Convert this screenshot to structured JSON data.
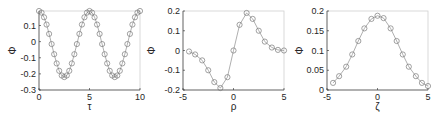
{
  "figure": {
    "background": "#ffffff",
    "axis_color": "#262626",
    "frame_color": "#d0d0d0",
    "line_color": "#8c8c8c",
    "marker_color": "#7a7a7a"
  },
  "chart_data": [
    {
      "type": "line",
      "title": "",
      "xlabel": "τ",
      "ylabel": "Φ",
      "xlim": [
        0,
        10
      ],
      "ylim": [
        -0.3,
        0.19
      ],
      "xticks": [
        0,
        5,
        10
      ],
      "xtick_labels": [
        "0",
        "5",
        "10"
      ],
      "yticks": [
        -0.3,
        -0.2,
        -0.1,
        0,
        0.1
      ],
      "ytick_labels": [
        "-0.3",
        "-0.2",
        "-0.1",
        "0",
        "0.1"
      ],
      "grid": false,
      "marker": "circle",
      "x": [
        0,
        0.25,
        0.5,
        0.75,
        1,
        1.25,
        1.5,
        1.75,
        2,
        2.25,
        2.5,
        2.75,
        3,
        3.25,
        3.5,
        3.75,
        4,
        4.25,
        4.5,
        4.75,
        5,
        5.25,
        5.5,
        5.75,
        6,
        6.25,
        6.5,
        6.75,
        7,
        7.25,
        7.5,
        7.75,
        8,
        8.25,
        8.5,
        8.75,
        9,
        9.25,
        9.5,
        9.75,
        10
      ],
      "y": [
        0.19,
        0.18,
        0.151,
        0.106,
        0.048,
        -0.015,
        -0.078,
        -0.135,
        -0.181,
        -0.21,
        -0.22,
        -0.21,
        -0.181,
        -0.135,
        -0.078,
        -0.015,
        0.048,
        0.106,
        0.151,
        0.18,
        0.19,
        0.18,
        0.151,
        0.106,
        0.048,
        -0.015,
        -0.078,
        -0.135,
        -0.181,
        -0.21,
        -0.22,
        -0.21,
        -0.181,
        -0.135,
        -0.078,
        -0.015,
        0.048,
        0.106,
        0.151,
        0.18,
        0.19
      ]
    },
    {
      "type": "line",
      "title": "",
      "xlabel": "ρ",
      "ylabel": "Φ",
      "xlim": [
        -5,
        5
      ],
      "ylim": [
        -0.2,
        0.2
      ],
      "xticks": [
        -5,
        0,
        5
      ],
      "xtick_labels": [
        "-5",
        "0",
        "5"
      ],
      "yticks": [
        -0.2,
        -0.1,
        0,
        0.1,
        0.2
      ],
      "ytick_labels": [
        "-0.2",
        "-0.1",
        "0",
        "0.1",
        "0.2"
      ],
      "grid": false,
      "marker": "circle",
      "x": [
        -4.4,
        -3.8,
        -3.1,
        -2.5,
        -1.9,
        -1.3,
        -0.6,
        0,
        0.6,
        1.3,
        1.9,
        2.5,
        3.1,
        3.8,
        4.4,
        5
      ],
      "y": [
        -0.005,
        -0.02,
        -0.05,
        -0.1,
        -0.16,
        -0.19,
        -0.135,
        0,
        0.13,
        0.19,
        0.16,
        0.1,
        0.045,
        0.015,
        0.003,
        0
      ]
    },
    {
      "type": "line",
      "title": "",
      "xlabel": "ζ",
      "ylabel": "Φ",
      "xlim": [
        -5,
        5
      ],
      "ylim": [
        0,
        0.2
      ],
      "xticks": [
        -5,
        0,
        5
      ],
      "xtick_labels": [
        "-5",
        "0",
        "5"
      ],
      "yticks": [
        0,
        0.05,
        0.1,
        0.15,
        0.2
      ],
      "ytick_labels": [
        "0",
        "0.05",
        "0.1",
        "0.15",
        "0.2"
      ],
      "grid": false,
      "marker": "circle",
      "x": [
        -4.4,
        -3.8,
        -3.1,
        -2.5,
        -1.9,
        -1.3,
        -0.6,
        0,
        0.6,
        1.3,
        1.9,
        2.5,
        3.1,
        3.8,
        4.4,
        5
      ],
      "y": [
        0.018,
        0.035,
        0.059,
        0.09,
        0.124,
        0.156,
        0.18,
        0.188,
        0.182,
        0.156,
        0.124,
        0.09,
        0.059,
        0.035,
        0.018,
        0.01
      ]
    }
  ]
}
